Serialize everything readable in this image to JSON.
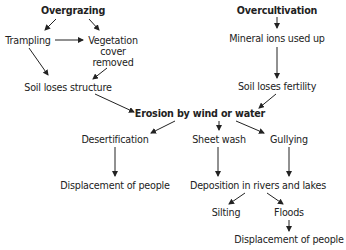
{
  "diagram": {
    "nodes": {
      "overgrazing": "Overgrazing",
      "overcultivation": "Overcultivation",
      "trampling": "Trampling",
      "vegetation_line1": "Vegetation",
      "vegetation_line2": "cover",
      "vegetation_line3": "removed",
      "mineral_ions": "Mineral ions used up",
      "soil_structure": "Soil loses structure",
      "soil_fertility": "Soil loses fertility",
      "erosion": "Erosion by wind or water",
      "desertification": "Desertification",
      "sheet_wash": "Sheet wash",
      "gullying": "Gullying",
      "displacement_1": "Displacement of people",
      "deposition": "Deposition in rivers and lakes",
      "silting": "Silting",
      "floods": "Floods",
      "displacement_2": "Displacement of people"
    },
    "edges": [
      {
        "from": "Overgrazing",
        "to": "Trampling"
      },
      {
        "from": "Overgrazing",
        "to": "Vegetation cover removed"
      },
      {
        "from": "Trampling",
        "to": "Vegetation cover removed"
      },
      {
        "from": "Trampling",
        "to": "Soil loses structure"
      },
      {
        "from": "Vegetation cover removed",
        "to": "Soil loses structure"
      },
      {
        "from": "Overcultivation",
        "to": "Mineral ions used up"
      },
      {
        "from": "Mineral ions used up",
        "to": "Soil loses fertility"
      },
      {
        "from": "Soil loses structure",
        "to": "Erosion by wind or water"
      },
      {
        "from": "Soil loses fertility",
        "to": "Erosion by wind or water"
      },
      {
        "from": "Erosion by wind or water",
        "to": "Desertification"
      },
      {
        "from": "Erosion by wind or water",
        "to": "Sheet wash"
      },
      {
        "from": "Erosion by wind or water",
        "to": "Gullying"
      },
      {
        "from": "Desertification",
        "to": "Displacement of people"
      },
      {
        "from": "Sheet wash",
        "to": "Deposition in rivers and lakes"
      },
      {
        "from": "Gullying",
        "to": "Deposition in rivers and lakes"
      },
      {
        "from": "Deposition in rivers and lakes",
        "to": "Silting"
      },
      {
        "from": "Deposition in rivers and lakes",
        "to": "Floods"
      },
      {
        "from": "Floods",
        "to": "Displacement of people"
      }
    ]
  }
}
